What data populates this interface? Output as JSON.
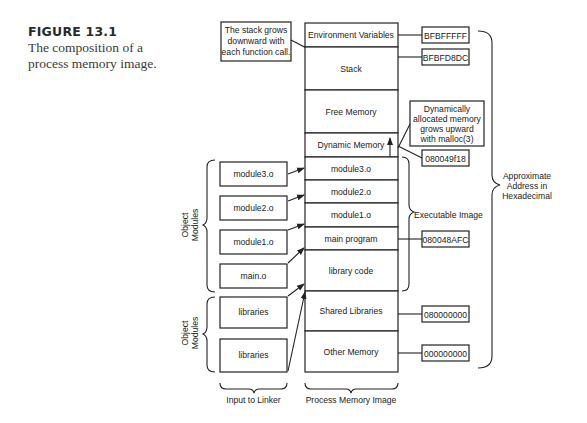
{
  "caption": {
    "number": "FIGURE 13.1",
    "text": "The composition of a process memory image."
  },
  "memory_image": {
    "segments": [
      {
        "label": "Environment Variables"
      },
      {
        "label": "Stack"
      },
      {
        "label": "Free Memory"
      },
      {
        "label": "Dynamic Memory"
      },
      {
        "label": "module3.o"
      },
      {
        "label": "module2.o"
      },
      {
        "label": "module1.o"
      },
      {
        "label": "main program"
      },
      {
        "label": "library code"
      },
      {
        "label": "Shared Libraries"
      },
      {
        "label": "Other Memory"
      }
    ],
    "footer_label": "Process Memory Image"
  },
  "linker_input": {
    "object_modules_label_1": "Object",
    "object_modules_label_2": "Modules",
    "modules": [
      {
        "label": "module3.o"
      },
      {
        "label": "module2.o"
      },
      {
        "label": "module1.o"
      },
      {
        "label": "main.o"
      }
    ],
    "libraries": [
      {
        "label": "libraries"
      },
      {
        "label": "libraries"
      }
    ],
    "footer_label": "Input to Linker"
  },
  "addresses": [
    {
      "value": "BFBFFFFF"
    },
    {
      "value": "BFBFD8DC"
    },
    {
      "value": "080049f18"
    },
    {
      "value": "080048AFC"
    },
    {
      "value": "080000000"
    },
    {
      "value": "000000000"
    }
  ],
  "annotations": {
    "stack_note": [
      "The stack grows",
      "downward with",
      "each function call."
    ],
    "heap_note": [
      "Dynamically",
      "allocated memory",
      "grows upward",
      "with malloc(3)"
    ],
    "executable_image": "Executable Image",
    "approx_address": [
      "Approximate",
      "Address in",
      "Hexadecimal"
    ]
  }
}
